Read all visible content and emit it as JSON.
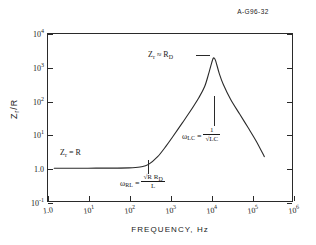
{
  "figure": {
    "id_label": "A-G96-32"
  },
  "chart_data": {
    "type": "line",
    "title": "",
    "subtitle": "",
    "xlabel": "FREQUENCY, Hz",
    "ylabel": "Zr /R",
    "xscale": "log",
    "yscale": "log",
    "xlim": [
      1,
      1000000
    ],
    "ylim": [
      0.1,
      10000
    ],
    "grid": false,
    "legend": "none",
    "xtick_labels": [
      "1.0",
      "10¹",
      "10²",
      "10³",
      "10⁴",
      "10⁵",
      "10⁶"
    ],
    "xtick_values": [
      1,
      10,
      100,
      1000,
      10000,
      100000,
      1000000
    ],
    "ytick_labels": [
      "10⁻¹",
      "1.0",
      "10¹",
      "10²",
      "10³",
      "10⁴"
    ],
    "ytick_values": [
      0.1,
      1,
      10,
      100,
      1000,
      10000
    ],
    "series": [
      {
        "name": "Zr/R vs frequency",
        "x": [
          1.5,
          10,
          100,
          200,
          300,
          500,
          800,
          1200,
          2000,
          3000,
          5000,
          7000,
          9000,
          11000,
          12000,
          13000,
          16000,
          20000,
          30000,
          50000,
          80000,
          130000,
          200000
        ],
        "y": [
          1.0,
          1.0,
          1.02,
          1.1,
          1.3,
          2.2,
          4.5,
          9,
          22,
          45,
          120,
          260,
          700,
          1650,
          1800,
          1500,
          620,
          300,
          110,
          40,
          16,
          6,
          2.2
        ]
      }
    ],
    "peak": {
      "x": 12000,
      "y": 1800
    },
    "annotations": [
      {
        "name": "low-frequency-asymptote",
        "text": "Zr = R",
        "x": 20,
        "y": 1.8
      },
      {
        "name": "peak-value",
        "text": "Zr ≈ RD",
        "x": 3000,
        "y": 3000
      },
      {
        "name": "resonance-frequency",
        "text": "ωLC = 1/√LC",
        "x": 12000,
        "y": 12
      },
      {
        "name": "corner-frequency",
        "text": "ωRL = √(R RD)/L",
        "x": 300,
        "y": 0.45
      }
    ]
  },
  "axis": {
    "x_title": "FREQUENCY,  Hz",
    "y_title_main": "Z",
    "y_title_sub": "r",
    "y_title_tail": "/R",
    "x_ticks": [
      {
        "label_base": "1.0",
        "label_exp": ""
      },
      {
        "label_base": "10",
        "label_exp": "1"
      },
      {
        "label_base": "10",
        "label_exp": "2"
      },
      {
        "label_base": "10",
        "label_exp": "3"
      },
      {
        "label_base": "10",
        "label_exp": "4"
      },
      {
        "label_base": "10",
        "label_exp": "5"
      },
      {
        "label_base": "10",
        "label_exp": "6"
      }
    ],
    "y_ticks": [
      {
        "label_base": "10",
        "label_exp": "4"
      },
      {
        "label_base": "10",
        "label_exp": "3"
      },
      {
        "label_base": "10",
        "label_exp": "2"
      },
      {
        "label_base": "10",
        "label_exp": "1"
      },
      {
        "label_base": "1.0",
        "label_exp": ""
      },
      {
        "label_base": "10",
        "label_exp": "-1"
      }
    ]
  },
  "annotations": {
    "zr_equals_r": {
      "symbol": "Z",
      "sub": "r",
      "rest": "= R"
    },
    "zr_approx_rd": {
      "symbol": "Z",
      "sub": "r",
      "rest": "≈ R",
      "rest_sub": "D"
    },
    "omega_lc": {
      "symbol": "ω",
      "sub": "LC",
      "eq": "=",
      "numerator": "1",
      "denominator": "√LC"
    },
    "omega_rl": {
      "symbol": "ω",
      "sub": "RL",
      "eq": "=",
      "numerator": "√R R",
      "numerator_sub": "D",
      "denominator": "L"
    }
  }
}
